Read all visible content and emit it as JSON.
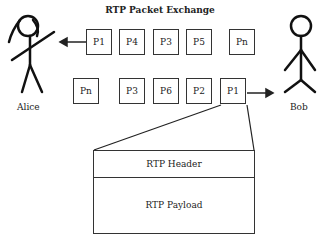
{
  "title": "RTP Packet Exchange",
  "actors": {
    "left": "Alice",
    "right": "Bob"
  },
  "row1": {
    "direction": "to-alice",
    "packets": [
      "P1",
      "P4",
      "P3",
      "P5",
      "Pn"
    ]
  },
  "row2": {
    "direction": "to-bob",
    "packets": [
      "Pn",
      "P3",
      "P6",
      "P2",
      "P1"
    ]
  },
  "packet_detail": {
    "header": "RTP Header",
    "payload": "RTP Payload"
  }
}
